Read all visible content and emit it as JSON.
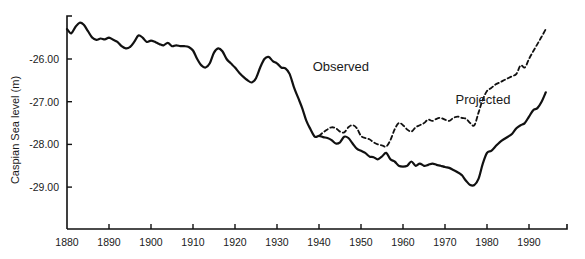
{
  "chart_data": {
    "type": "line",
    "title": "",
    "xlabel": "",
    "ylabel": "Caspian Sea level (m)",
    "xlim": [
      1880,
      1998
    ],
    "ylim": [
      -29.95,
      -25.0
    ],
    "grid": false,
    "legend": "inline labels",
    "x_ticks": [
      1880,
      1890,
      1900,
      1910,
      1920,
      1930,
      1940,
      1950,
      1960,
      1970,
      1980,
      1990
    ],
    "y_ticks": [
      -26.0,
      -27.0,
      -28.0,
      -29.0
    ],
    "y_tick_labels": [
      "-26.00",
      "-27.00",
      "-28.00",
      "-29.00"
    ],
    "annotations": [
      {
        "text": "Observed",
        "x": 1938.5,
        "y": -26.28
      },
      {
        "text": "Projected",
        "x": 1972.5,
        "y": -27.05
      }
    ],
    "series": [
      {
        "name": "Observed",
        "style": "solid",
        "color": "#111111",
        "x": [
          1880,
          1881,
          1882,
          1883,
          1884,
          1885,
          1886,
          1887,
          1888,
          1889,
          1890,
          1891,
          1892,
          1893,
          1894,
          1895,
          1896,
          1897,
          1898,
          1899,
          1900,
          1901,
          1902,
          1903,
          1904,
          1905,
          1906,
          1907,
          1908,
          1909,
          1910,
          1911,
          1912,
          1913,
          1914,
          1915,
          1916,
          1917,
          1918,
          1919,
          1920,
          1921,
          1922,
          1923,
          1924,
          1925,
          1926,
          1927,
          1928,
          1929,
          1930,
          1931,
          1932,
          1933,
          1934,
          1935,
          1936,
          1937,
          1938,
          1939,
          1940,
          1941,
          1942,
          1943,
          1944,
          1945,
          1946,
          1947,
          1948,
          1949,
          1950,
          1951,
          1952,
          1953,
          1954,
          1955,
          1956,
          1957,
          1958,
          1959,
          1960,
          1961,
          1962,
          1963,
          1964,
          1965,
          1966,
          1967,
          1968,
          1969,
          1970,
          1971,
          1972,
          1973,
          1974,
          1975,
          1976,
          1977,
          1978,
          1979,
          1980,
          1981,
          1982,
          1983,
          1984,
          1985,
          1986,
          1987,
          1988,
          1989,
          1990,
          1991,
          1992,
          1993,
          1994
        ],
        "values": [
          -25.3,
          -25.4,
          -25.25,
          -25.15,
          -25.2,
          -25.35,
          -25.5,
          -25.55,
          -25.52,
          -25.54,
          -25.5,
          -25.55,
          -25.6,
          -25.7,
          -25.75,
          -25.72,
          -25.6,
          -25.45,
          -25.5,
          -25.6,
          -25.57,
          -25.6,
          -25.65,
          -25.68,
          -25.62,
          -25.7,
          -25.68,
          -25.7,
          -25.7,
          -25.72,
          -25.8,
          -26.0,
          -26.15,
          -26.2,
          -26.1,
          -25.85,
          -25.75,
          -25.82,
          -26.0,
          -26.1,
          -26.2,
          -26.32,
          -26.42,
          -26.5,
          -26.55,
          -26.45,
          -26.2,
          -26.0,
          -25.95,
          -26.05,
          -26.1,
          -26.2,
          -26.22,
          -26.35,
          -26.65,
          -26.9,
          -27.15,
          -27.45,
          -27.65,
          -27.82,
          -27.8,
          -27.83,
          -27.85,
          -27.9,
          -27.98,
          -27.95,
          -27.82,
          -27.85,
          -27.98,
          -28.1,
          -28.15,
          -28.2,
          -28.28,
          -28.3,
          -28.35,
          -28.28,
          -28.2,
          -28.35,
          -28.4,
          -28.5,
          -28.52,
          -28.5,
          -28.4,
          -28.5,
          -28.45,
          -28.5,
          -28.48,
          -28.45,
          -28.48,
          -28.5,
          -28.53,
          -28.55,
          -28.6,
          -28.65,
          -28.72,
          -28.85,
          -28.95,
          -28.95,
          -28.8,
          -28.45,
          -28.2,
          -28.15,
          -28.05,
          -27.95,
          -27.88,
          -27.82,
          -27.75,
          -27.62,
          -27.55,
          -27.5,
          -27.35,
          -27.2,
          -27.15,
          -27.0,
          -26.78
        ]
      },
      {
        "name": "Projected",
        "style": "dashed",
        "color": "#111111",
        "x": [
          1940,
          1941,
          1942,
          1943,
          1944,
          1945,
          1946,
          1947,
          1948,
          1949,
          1950,
          1951,
          1952,
          1953,
          1954,
          1955,
          1956,
          1957,
          1958,
          1959,
          1960,
          1961,
          1962,
          1963,
          1964,
          1965,
          1966,
          1967,
          1968,
          1969,
          1970,
          1971,
          1972,
          1973,
          1974,
          1975,
          1976,
          1977,
          1978,
          1979,
          1980,
          1981,
          1982,
          1983,
          1984,
          1985,
          1986,
          1987,
          1988,
          1989,
          1990,
          1991,
          1992,
          1993,
          1994
        ],
        "values": [
          -27.8,
          -27.72,
          -27.65,
          -27.6,
          -27.62,
          -27.7,
          -27.72,
          -27.6,
          -27.55,
          -27.62,
          -27.8,
          -27.85,
          -27.88,
          -27.95,
          -28.0,
          -28.02,
          -28.05,
          -27.9,
          -27.65,
          -27.5,
          -27.55,
          -27.65,
          -27.7,
          -27.6,
          -27.55,
          -27.5,
          -27.42,
          -27.45,
          -27.4,
          -27.38,
          -27.42,
          -27.45,
          -27.38,
          -27.35,
          -27.38,
          -27.4,
          -27.5,
          -27.55,
          -27.25,
          -26.95,
          -26.75,
          -26.68,
          -26.6,
          -26.55,
          -26.5,
          -26.45,
          -26.4,
          -26.35,
          -26.15,
          -26.2,
          -26.0,
          -25.82,
          -25.65,
          -25.48,
          -25.3
        ]
      }
    ]
  }
}
